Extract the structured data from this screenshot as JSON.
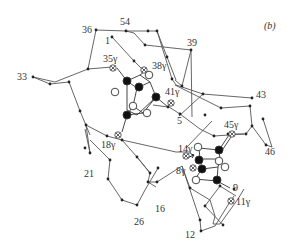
{
  "panel_label": "(b)",
  "colors": {
    "line": "#444444",
    "dot": "#222222",
    "filled_atom": "#111111",
    "open_atom_fill": "#ffffff",
    "text": "#333333"
  },
  "labels": [
    {
      "id": "l54",
      "text": "54",
      "x": 120,
      "y": 24
    },
    {
      "id": "l36",
      "text": "36",
      "x": 82,
      "y": 33
    },
    {
      "id": "l1",
      "text": "1",
      "x": 105,
      "y": 43
    },
    {
      "id": "l39",
      "text": "39",
      "x": 187,
      "y": 46
    },
    {
      "id": "l35g",
      "text": "35γ",
      "x": 103,
      "y": 61
    },
    {
      "id": "l38g",
      "text": "38γ",
      "x": 152,
      "y": 69
    },
    {
      "id": "l33",
      "text": "33",
      "x": 17,
      "y": 80
    },
    {
      "id": "l41g",
      "text": "41γ",
      "x": 165,
      "y": 94
    },
    {
      "id": "l43",
      "text": "43",
      "x": 256,
      "y": 98
    },
    {
      "id": "l5",
      "text": "5",
      "x": 177,
      "y": 122
    },
    {
      "id": "l45g",
      "text": "45γ",
      "x": 224,
      "y": 127
    },
    {
      "id": "l18g",
      "text": "18γ",
      "x": 101,
      "y": 148
    },
    {
      "id": "l46",
      "text": "46",
      "x": 265,
      "y": 155
    },
    {
      "id": "l14g",
      "text": "14γ",
      "x": 178,
      "y": 152
    },
    {
      "id": "l8g",
      "text": "8γ",
      "x": 176,
      "y": 174
    },
    {
      "id": "l9",
      "text": "9",
      "x": 233,
      "y": 191
    },
    {
      "id": "l21",
      "text": "21",
      "x": 84,
      "y": 177
    },
    {
      "id": "l11g",
      "text": "11γ",
      "x": 236,
      "y": 205
    },
    {
      "id": "l16",
      "text": "16",
      "x": 155,
      "y": 212
    },
    {
      "id": "l26",
      "text": "26",
      "x": 134,
      "y": 225
    },
    {
      "id": "l12",
      "text": "12",
      "x": 185,
      "y": 238
    }
  ],
  "backbone_path": [
    [
      96,
      30
    ],
    [
      126,
      30
    ],
    [
      149,
      31
    ],
    [
      152,
      31
    ],
    [
      171,
      79
    ],
    [
      175,
      85
    ],
    [
      203,
      94
    ],
    [
      253,
      98
    ],
    [
      251,
      108
    ],
    [
      216,
      108
    ],
    [
      205,
      114
    ],
    [
      159,
      115
    ],
    [
      116,
      62
    ],
    [
      127,
      31
    ],
    [
      95,
      30
    ],
    [
      88,
      69
    ],
    [
      112,
      67
    ],
    [
      55,
      82
    ],
    [
      32,
      77
    ],
    [
      50,
      82
    ],
    [
      69,
      82
    ],
    [
      80,
      111
    ],
    [
      117,
      139
    ],
    [
      136,
      156
    ],
    [
      147,
      173
    ],
    [
      151,
      190
    ],
    [
      142,
      212
    ],
    [
      137,
      217
    ],
    [
      120,
      214
    ],
    [
      107,
      187
    ],
    [
      110,
      169
    ],
    [
      90,
      153
    ],
    [
      86,
      132
    ],
    [
      100,
      139
    ],
    [
      122,
      139
    ],
    [
      186,
      148
    ],
    [
      145,
      177
    ]
  ],
  "backbone_paths": [
    [
      [
        95,
        30
      ],
      [
        126,
        31
      ],
      [
        149,
        31
      ],
      [
        163,
        80
      ],
      [
        203,
        94
      ],
      [
        253,
        98
      ]
    ],
    [
      [
        126,
        31
      ],
      [
        134,
        33
      ],
      [
        145,
        45
      ],
      [
        182,
        50
      ],
      [
        192,
        117
      ]
    ],
    [
      [
        182,
        50
      ],
      [
        176,
        80
      ]
    ],
    [
      [
        163,
        80
      ],
      [
        219,
        102
      ]
    ],
    [
      [
        95,
        30
      ],
      [
        87,
        69
      ],
      [
        112,
        67
      ]
    ],
    [
      [
        87,
        69
      ],
      [
        55,
        82
      ],
      [
        32,
        77
      ],
      [
        50,
        84
      ],
      [
        69,
        82
      ],
      [
        80,
        112
      ]
    ],
    [
      [
        112,
        37
      ],
      [
        134,
        61
      ],
      [
        144,
        71
      ]
    ],
    [
      [
        203,
        94
      ],
      [
        176,
        116
      ]
    ],
    [
      [
        219,
        102
      ],
      [
        250,
        106
      ],
      [
        252,
        126
      ],
      [
        246,
        135
      ],
      [
        226,
        134
      ]
    ],
    [
      [
        252,
        126
      ],
      [
        266,
        145
      ],
      [
        272,
        147
      ],
      [
        262,
        120
      ]
    ],
    [
      [
        80,
        112
      ],
      [
        96,
        122
      ]
    ]
  ]
}
